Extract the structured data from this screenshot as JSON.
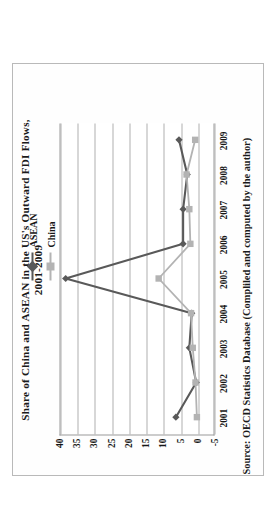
{
  "figure": {
    "title_line1": "Share of China and ASEAN in the US's Outward FDI Flows,",
    "title_line2": "2001-2009",
    "source": "Source: OECD Statistics Database (Compliled and computed by the author)"
  },
  "legend": {
    "items": [
      {
        "label": "ASEAN",
        "color": "#595959",
        "marker": "diamond"
      },
      {
        "label": "China",
        "color": "#b3b3b3",
        "marker": "square"
      }
    ]
  },
  "chart_data": {
    "type": "line",
    "title": "Share of China and ASEAN in the US's Outward FDI Flows, 2001-2009",
    "xlabel": "",
    "ylabel": "",
    "categories": [
      "2001",
      "2002",
      "2003",
      "2004",
      "2005",
      "2006",
      "2007",
      "2008",
      "2009"
    ],
    "x": [
      "2001",
      "2002",
      "2003",
      "2004",
      "2005",
      "2006",
      "2007",
      "2008",
      "2009"
    ],
    "series": [
      {
        "name": "ASEAN",
        "color": "#595959",
        "marker": "diamond",
        "values": [
          6.5,
          0.6,
          2.6,
          1.9,
          38.5,
          4.4,
          4.4,
          3.2,
          5.6
        ]
      },
      {
        "name": "China",
        "color": "#b3b3b3",
        "marker": "square",
        "values": [
          0.4,
          0.8,
          1.6,
          2.1,
          11.5,
          2.3,
          2.6,
          3.4,
          0.9
        ]
      }
    ],
    "yticks": [
      40,
      35,
      30,
      25,
      20,
      15,
      10,
      5,
      0,
      -5
    ],
    "ytick_labels": [
      "40",
      "35",
      "30",
      "25",
      "20",
      "15",
      "10",
      "5",
      "0",
      "-5"
    ],
    "ylim": [
      -5,
      40
    ],
    "grid": true,
    "grid_axis": "y",
    "legend_position": "top-right"
  }
}
